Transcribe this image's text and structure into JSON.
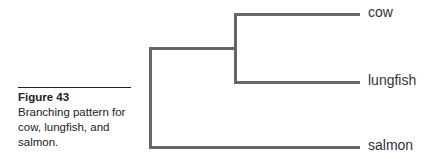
{
  "caption": {
    "title": "Figure 43",
    "text": "Branching pattern for cow, lungfish, and salmon."
  },
  "tree": {
    "line_color": "#666666",
    "leaves": [
      {
        "label": "cow"
      },
      {
        "label": "lungfish"
      },
      {
        "label": "salmon"
      }
    ]
  }
}
